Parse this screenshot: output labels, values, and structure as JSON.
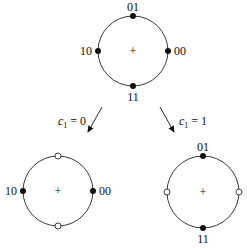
{
  "diagram": {
    "type": "constellation-partition",
    "top": {
      "center_mark": "+",
      "points": [
        {
          "label": "01",
          "position": "top",
          "filled": true
        },
        {
          "label": "00",
          "position": "right",
          "filled": true
        },
        {
          "label": "11",
          "position": "bottom",
          "filled": true
        },
        {
          "label": "10",
          "position": "left",
          "filled": true
        }
      ]
    },
    "arrows": [
      {
        "label_var": "c",
        "label_sub": "1",
        "label_rest": " = 0",
        "direction": "down-left"
      },
      {
        "label_var": "c",
        "label_sub": "1",
        "label_rest": " = 1",
        "direction": "down-right"
      }
    ],
    "bottom_left": {
      "center_mark": "+",
      "points": [
        {
          "label": "",
          "position": "top",
          "filled": false
        },
        {
          "label": "00",
          "position": "right",
          "filled": true
        },
        {
          "label": "",
          "position": "bottom",
          "filled": false
        },
        {
          "label": "10",
          "position": "left",
          "filled": true
        }
      ]
    },
    "bottom_right": {
      "center_mark": "+",
      "points": [
        {
          "label": "01",
          "position": "top",
          "filled": true
        },
        {
          "label": "",
          "position": "right",
          "filled": false
        },
        {
          "label": "11",
          "position": "bottom",
          "filled": true
        },
        {
          "label": "",
          "position": "left",
          "filled": false
        }
      ]
    }
  }
}
